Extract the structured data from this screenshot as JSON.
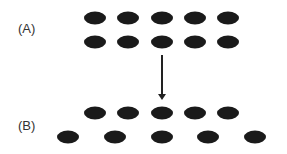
{
  "labels": {
    "a": "(A)",
    "b": "(B)"
  },
  "panel_a": {
    "rows": [
      {
        "y": 18,
        "x": [
          95,
          128,
          162,
          195,
          228
        ]
      },
      {
        "y": 42,
        "x": [
          95,
          128,
          162,
          195,
          228
        ]
      }
    ]
  },
  "panel_b": {
    "rows": [
      {
        "y": 113,
        "x": [
          95,
          128,
          162,
          195,
          228
        ]
      },
      {
        "y": 137,
        "x": [
          68,
          115,
          162,
          208,
          255
        ]
      }
    ]
  },
  "arrow": {
    "direction": "down",
    "from": "A",
    "to": "B"
  },
  "colors": {
    "dot": "#1a1a1a",
    "text": "#333333"
  }
}
